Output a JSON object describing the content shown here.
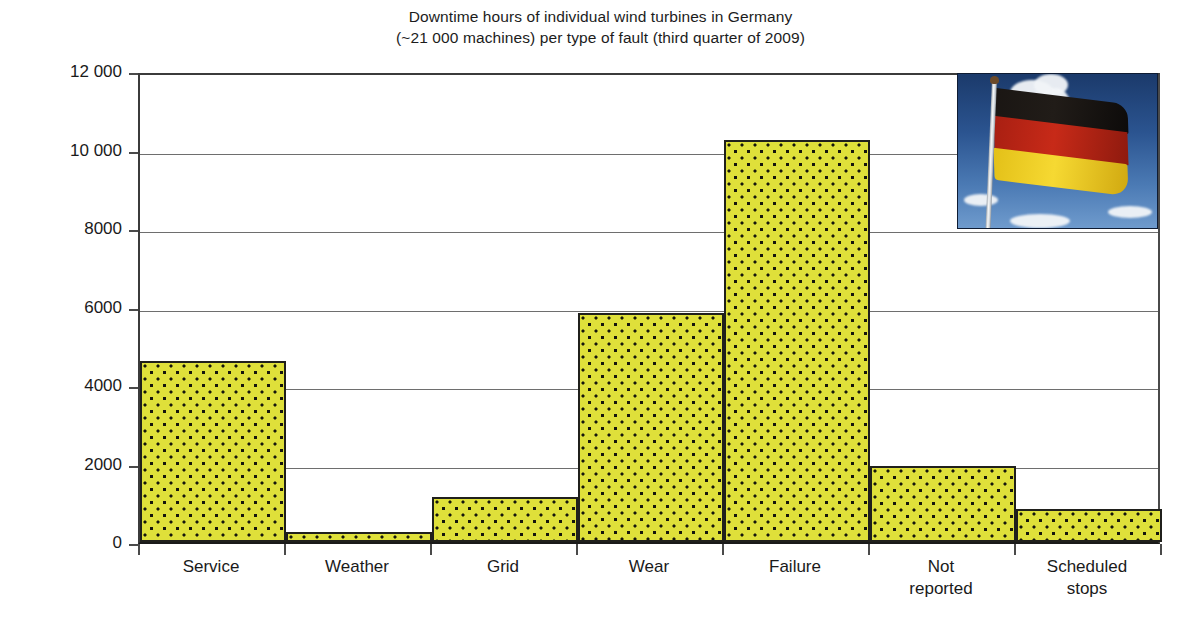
{
  "title": {
    "line1": "Downtime hours of individual wind turbines in Germany",
    "line2": "(~21 000 machines) per type of fault (third quarter of 2009)"
  },
  "axes": {
    "y_title": "Downtime hours",
    "y_ticks": [
      "12 000",
      "10 000",
      "8000",
      "6000",
      "4000",
      "2000",
      "0"
    ],
    "x_labels": [
      {
        "line1": "Service",
        "line2": ""
      },
      {
        "line1": "Weather",
        "line2": ""
      },
      {
        "line1": "Grid",
        "line2": ""
      },
      {
        "line1": "Wear",
        "line2": ""
      },
      {
        "line1": "Failure",
        "line2": ""
      },
      {
        "line1": "Not",
        "line2": "reported"
      },
      {
        "line1": "Scheduled",
        "line2": "stops"
      }
    ]
  },
  "image_overlay": {
    "name": "germany-flag-photo",
    "description": "Photograph of the German national flag on a pole against a blue sky with clouds"
  },
  "colors": {
    "bar_fill": "#dfe03a",
    "bar_pattern_dot": "#15150d",
    "bar_border": "#20201c",
    "gridline": "#6e6e6e",
    "axis": "#1a1a1a",
    "text": "#1a1a1a",
    "flag_black": "#1a1613",
    "flag_red": "#c72a18",
    "flag_gold": "#f6d932",
    "sky_blue": "#2b5490"
  },
  "chart_data": {
    "type": "bar",
    "title": "Downtime hours of individual wind turbines in Germany (~21 000 machines) per type of fault (third quarter of 2009)",
    "xlabel": "",
    "ylabel": "Downtime hours",
    "ylim": [
      0,
      12000
    ],
    "ytick_values": [
      0,
      2000,
      4000,
      6000,
      8000,
      10000,
      12000
    ],
    "grid": "horizontal",
    "legend": "none",
    "bar_gap": 0,
    "categories": [
      "Service",
      "Weather",
      "Grid",
      "Wear",
      "Failure",
      "Not reported",
      "Scheduled stops"
    ],
    "values": [
      4600,
      250,
      1150,
      5830,
      10250,
      1930,
      850
    ]
  }
}
